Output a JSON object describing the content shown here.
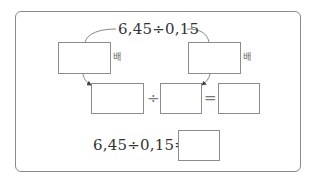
{
  "diagram": {
    "top_expression": "6,45÷0,15",
    "left_multiplier_label": "배",
    "right_multiplier_label": "배",
    "middle_row": {
      "operator_divide": "÷",
      "operator_equals": "="
    },
    "bottom_expression": "6,45÷0,15=",
    "colors": {
      "border": "#8c8c8c",
      "text": "#333333",
      "frame": "#8a8a8a"
    }
  }
}
